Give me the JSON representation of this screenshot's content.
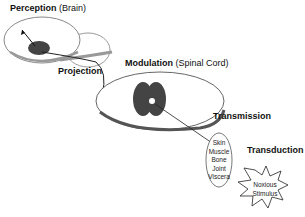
{
  "diagram": {
    "labels": {
      "perception": {
        "title": "Perception",
        "sub": "(Brain)"
      },
      "projection": {
        "title": "Projection"
      },
      "modulation": {
        "title": "Modulation",
        "sub": "(Spinal Cord)"
      },
      "transmission": {
        "title": "Transmission"
      },
      "transduction": {
        "title": "Transduction"
      }
    },
    "tissues": [
      "Skin",
      "Muscle",
      "Bone",
      "Joint",
      "Viscera"
    ],
    "stimulus": [
      "Noxious",
      "Stimulus"
    ]
  }
}
